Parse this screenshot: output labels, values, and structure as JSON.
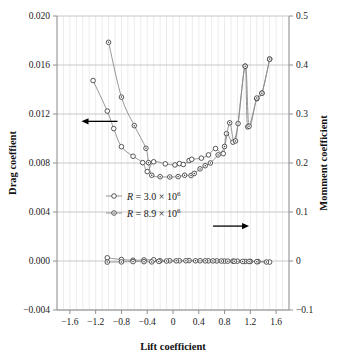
{
  "chart_data": {
    "type": "scatter",
    "title": "",
    "xlabel": "Lift coefficient",
    "ylabel": "Drag coeffient",
    "y2label": "Momment coefficient",
    "xlim": [
      -1.8,
      1.8
    ],
    "ylim": [
      -0.004,
      0.02
    ],
    "y2lim": [
      -0.1,
      0.5
    ],
    "grid": true,
    "legend_position": "center-left",
    "xticks": [
      "-1.6",
      "-1.2",
      "-0.8",
      "-0.4",
      "0",
      "0.4",
      "0.8",
      "1.2",
      "1.6"
    ],
    "xtick_values": [
      -1.6,
      -1.2,
      -0.8,
      -0.4,
      0,
      0.4,
      0.8,
      1.2,
      1.6
    ],
    "yticks": [
      "0.020",
      "0.016",
      "0.012",
      "0.008",
      "0.004",
      "0.000",
      "-0.004"
    ],
    "ytick_values": [
      0.02,
      0.016,
      0.012,
      0.008,
      0.004,
      0.0,
      -0.004
    ],
    "y2ticks": [
      "0.5",
      "0.4",
      "0.3",
      "0.2",
      "0.1",
      "0",
      "-0.1"
    ],
    "y2tick_values": [
      0.5,
      0.4,
      0.3,
      0.2,
      0.1,
      0.0,
      -0.1
    ],
    "legend": [
      {
        "label_prefix": "R",
        "label_eq": " = 3.0 × 10",
        "label_exp": "6",
        "marker": "circle",
        "series": "drag_R3.0e6"
      },
      {
        "label_prefix": "R",
        "label_eq": " = 8.9 × 10",
        "label_exp": "6",
        "marker": "circle-dot",
        "series": "drag_R8.9e6"
      }
    ],
    "annotations": [
      {
        "name": "left-axis-arrow",
        "text": "",
        "direction": "left",
        "x": -1.42,
        "y": 0.0114
      },
      {
        "name": "right-axis-arrow",
        "text": "",
        "direction": "right",
        "x": 1.18,
        "y": 0.00285
      }
    ],
    "series": [
      {
        "name": "Drag coefficient, R = 3.0 × 10^6",
        "axis": "left",
        "marker": "circle",
        "points": [
          [
            -1.24,
            0.01473
          ],
          [
            -1.02,
            0.01224
          ],
          [
            -0.92,
            0.01081
          ],
          [
            -0.8,
            0.00933
          ],
          [
            -0.62,
            0.00855
          ],
          [
            -0.47,
            0.00803
          ],
          [
            -0.4,
            0.0073
          ],
          [
            -0.3,
            0.0081
          ],
          [
            -0.12,
            0.00793
          ],
          [
            0.03,
            0.00784
          ],
          [
            0.1,
            0.00795
          ],
          [
            0.16,
            0.00788
          ],
          [
            0.25,
            0.0082
          ],
          [
            0.29,
            0.0083
          ],
          [
            0.44,
            0.0084
          ],
          [
            0.55,
            0.00866
          ],
          [
            0.66,
            0.00918
          ],
          [
            0.78,
            0.00876
          ],
          [
            0.83,
            0.0104
          ],
          [
            0.93,
            0.0097
          ],
          [
            1.01,
            0.01122
          ],
          [
            1.12,
            0.0159
          ],
          [
            1.16,
            0.01095
          ],
          [
            1.3,
            0.01325
          ],
          [
            1.38,
            0.0137
          ],
          [
            1.5,
            0.01648
          ]
        ]
      },
      {
        "name": "Drag coefficient, R = 8.9 × 10^6",
        "axis": "left",
        "marker": "circle-dot",
        "points": [
          [
            -1.0,
            0.01785
          ],
          [
            -0.8,
            0.01338
          ],
          [
            -0.6,
            0.01105
          ],
          [
            -0.42,
            0.0092
          ],
          [
            -0.38,
            0.00803
          ],
          [
            -0.33,
            0.007
          ],
          [
            -0.2,
            0.00688
          ],
          [
            -0.05,
            0.00686
          ],
          [
            0.08,
            0.00689
          ],
          [
            0.18,
            0.007
          ],
          [
            0.28,
            0.00698
          ],
          [
            0.33,
            0.00715
          ],
          [
            0.42,
            0.00752
          ],
          [
            0.5,
            0.00778
          ],
          [
            0.58,
            0.008
          ],
          [
            0.7,
            0.00866
          ],
          [
            0.8,
            0.00935
          ],
          [
            0.88,
            0.01128
          ],
          [
            0.97,
            0.0098
          ],
          [
            1.12,
            0.0159
          ],
          [
            1.18,
            0.011
          ],
          [
            1.3,
            0.0133
          ],
          [
            1.38,
            0.0137
          ],
          [
            1.5,
            0.01648
          ]
        ]
      },
      {
        "name": "Moment coefficient, R = 3.0 × 10^6",
        "axis": "right",
        "marker": "circle",
        "points": [
          [
            -1.02,
            0.0065
          ],
          [
            -0.8,
            0.003
          ],
          [
            -0.62,
            0.0015
          ],
          [
            -0.45,
            0.0022
          ],
          [
            -0.3,
            0.0025
          ],
          [
            -0.2,
            0.0005
          ],
          [
            -0.05,
            0.0005
          ],
          [
            0.1,
            0.0005
          ],
          [
            0.25,
            0.0008
          ],
          [
            0.42,
            0.0005
          ],
          [
            0.55,
            0.0003
          ],
          [
            0.68,
            0.0002
          ],
          [
            0.8,
            -0.0002
          ],
          [
            0.93,
            -0.0003
          ],
          [
            1.0,
            -0.0004
          ],
          [
            1.12,
            -0.001
          ],
          [
            1.2,
            -0.0008
          ],
          [
            1.32,
            -0.0012
          ],
          [
            1.5,
            -0.0022
          ]
        ]
      },
      {
        "name": "Moment coefficient, R = 8.9 × 10^6",
        "axis": "right",
        "marker": "circle-dot",
        "points": [
          [
            -1.02,
            -0.0022
          ],
          [
            -0.8,
            -0.0018
          ],
          [
            -0.62,
            -0.0012
          ],
          [
            -0.45,
            -0.0014
          ],
          [
            -0.33,
            -0.0018
          ],
          [
            -0.22,
            -0.0008
          ],
          [
            -0.1,
            0.0
          ],
          [
            0.05,
            0.0003
          ],
          [
            0.2,
            0.0005
          ],
          [
            0.35,
            0.0004
          ],
          [
            0.5,
            0.0003
          ],
          [
            0.62,
            0.0002
          ],
          [
            0.75,
            0.0
          ],
          [
            0.85,
            -0.0003
          ],
          [
            0.95,
            -0.0005
          ],
          [
            1.08,
            -0.0008
          ],
          [
            1.18,
            -0.001
          ],
          [
            1.3,
            -0.0014
          ],
          [
            1.45,
            -0.002
          ]
        ]
      }
    ]
  },
  "colors": {
    "line": "#8a8a8a",
    "marker_stroke": "#3a3a3a",
    "grid": "#c8c8c8",
    "axis": "#909090",
    "text": "#1a1a1a",
    "arrow": "#000000",
    "background": "#ffffff"
  }
}
